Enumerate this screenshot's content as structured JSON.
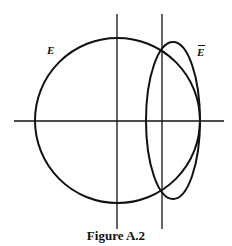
{
  "figure": {
    "caption": "Figure A.2",
    "labels": {
      "circle": "E",
      "ellipse": "E"
    },
    "ellipse_label_accent": "bar",
    "stroke_color": "#111111",
    "background_color": "#ffffff"
  },
  "diagram_elements": [
    {
      "type": "axis",
      "orientation": "horizontal",
      "description": "horizontal axis through circle center"
    },
    {
      "type": "axis",
      "orientation": "vertical",
      "description": "vertical axis through circle center"
    },
    {
      "type": "line",
      "orientation": "vertical",
      "description": "vertical line through intersection points of E and Ē"
    },
    {
      "type": "circle",
      "label": "E",
      "description": "large circle centered at origin"
    },
    {
      "type": "ellipse",
      "label": "Ē",
      "description": "tall narrow ellipse tangent to circle at right side, crossing it on the vertical line"
    }
  ]
}
